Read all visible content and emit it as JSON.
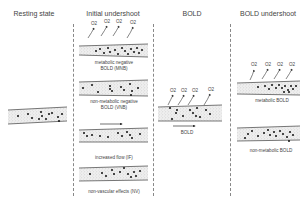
{
  "columns": [
    {
      "title": "Resting state"
    },
    {
      "title": "Initial undershoot"
    },
    {
      "title": "BOLD"
    },
    {
      "title": "BOLD undershoot"
    }
  ],
  "initial_undershoot": {
    "panels": [
      {
        "label_line1": "metabolic negative",
        "label_line2": "BOLD (MNB)",
        "has_o2": true,
        "has_flow_arrow": false
      },
      {
        "label_line1": "non-metabolic negative",
        "label_line2": "BOLD (VNB)",
        "has_o2": false,
        "has_flow_arrow": false
      },
      {
        "label_line1": "increased flow (IF)",
        "label_line2": "",
        "has_o2": false,
        "has_flow_arrow": true
      },
      {
        "label_line1": "non-vascular effects (NV)",
        "label_line2": "",
        "has_o2": false,
        "has_flow_arrow": false
      }
    ]
  },
  "bold": {
    "label": "BOLD",
    "has_o2": true,
    "has_flow_arrow": true
  },
  "bold_undershoot": {
    "panels": [
      {
        "label": "metabolic BOLD",
        "has_o2": true
      },
      {
        "label": "non-metabolic BOLD",
        "has_o2": false
      }
    ]
  },
  "o2_label": "O2",
  "colors": {
    "vessel_wall": "#555555",
    "vessel_fill": "#e6e6e6",
    "rbc_dot": "#111111",
    "divider": "#888888",
    "text": "#444444"
  }
}
